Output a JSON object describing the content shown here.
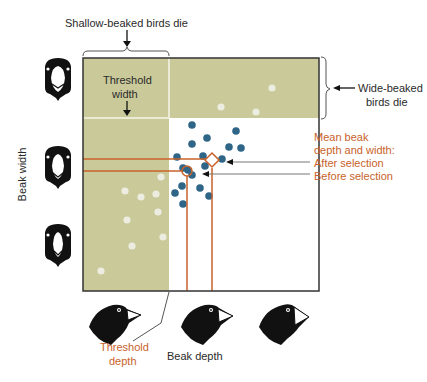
{
  "labels": {
    "shallow_die": "Shallow-beaked birds die",
    "wide_die_line1": "Wide-beaked",
    "wide_die_line2": "birds die",
    "threshold_width_line1": "Threshold",
    "threshold_width_line2": "width",
    "mean_line1": "Mean beak",
    "mean_line2": "depth and width:",
    "after_selection": "After  selection",
    "before_selection": "Before  selection",
    "beak_width_axis": "Beak width",
    "beak_depth_axis": "Beak depth",
    "threshold_depth_line1": "Threshold",
    "threshold_depth_line2": "depth"
  },
  "colors": {
    "dead_zone": "#c9c99a",
    "surviving_dot": "#2f6688",
    "dead_dot": "#ecece0",
    "accent": "#c8622a",
    "frame": "#333333"
  },
  "plot": {
    "left": 83,
    "top": 58,
    "right": 319,
    "bottom": 291,
    "threshold_depth_x": 169,
    "threshold_width_y": 118,
    "mean_after": {
      "x": 212,
      "y": 162
    },
    "mean_before": {
      "x": 187,
      "y": 171
    }
  },
  "surviving_dots": [
    [
      192,
      125
    ],
    [
      236,
      131
    ],
    [
      192,
      144
    ],
    [
      207,
      138
    ],
    [
      229,
      147
    ],
    [
      241,
      148
    ],
    [
      177,
      157
    ],
    [
      203,
      156
    ],
    [
      222,
      159
    ],
    [
      205,
      166
    ],
    [
      183,
      168
    ],
    [
      188,
      170
    ],
    [
      192,
      175
    ],
    [
      182,
      186
    ],
    [
      175,
      193
    ],
    [
      200,
      188
    ],
    [
      209,
      196
    ],
    [
      183,
      204
    ]
  ],
  "dead_dots": [
    [
      272,
      88
    ],
    [
      221,
      107
    ],
    [
      256,
      112
    ],
    [
      161,
      177
    ],
    [
      125,
      191
    ],
    [
      141,
      197
    ],
    [
      156,
      194
    ],
    [
      158,
      212
    ],
    [
      127,
      220
    ],
    [
      163,
      237
    ],
    [
      132,
      246
    ],
    [
      101,
      271
    ]
  ]
}
